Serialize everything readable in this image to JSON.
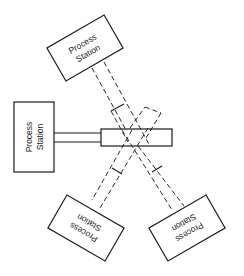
{
  "diagram": {
    "title": "",
    "stations": [
      {
        "id": "top",
        "line1": "Process",
        "line2": "Station"
      },
      {
        "id": "left",
        "line1": "Process",
        "line2": "Station"
      },
      {
        "id": "bottom-left",
        "line1": "Process",
        "line2": "Station"
      },
      {
        "id": "bottom-right",
        "line1": "Process",
        "line2": "Station"
      }
    ],
    "center": {
      "label": ""
    },
    "colors": {
      "line": "#1a1a1a",
      "background": "#ffffff"
    }
  }
}
